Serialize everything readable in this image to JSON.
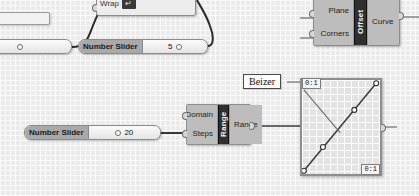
{
  "app": {
    "name": "Grasshopper Canvas",
    "background_color": "#ebebeb"
  },
  "components": {
    "wrap": {
      "label": "Wrap",
      "toggle_glyph": "↵"
    },
    "offset": {
      "name": "Offset",
      "inputs": [
        "Plane",
        "Corners"
      ],
      "outputs": [
        "Curve"
      ]
    },
    "range": {
      "name": "Range",
      "inputs": [
        "Domain",
        "Steps"
      ],
      "outputs": [
        "Range"
      ]
    }
  },
  "sliders": {
    "top": {
      "label": "Number Slider",
      "value": "5"
    },
    "bottom": {
      "label": "Number Slider",
      "value": "20"
    }
  },
  "callout": {
    "text": "Beizer"
  },
  "graph_mapper": {
    "top_left_tag": "0:1",
    "bottom_right_tag": "0:1",
    "curve_type": "Bezier"
  },
  "colors": {
    "component_body": "#b4b4b4",
    "component_name_bg": "#2f2f2f",
    "slider_label_bg": "#a9a9a9",
    "wire": "#2b2b2b"
  }
}
